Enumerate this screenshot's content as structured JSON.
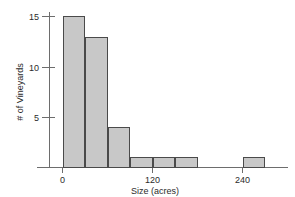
{
  "chart_data": {
    "type": "bar",
    "title": "",
    "subtitle": "",
    "xlabel": "Size (acres)",
    "ylabel": "# of Vineyards",
    "bin_width": 30,
    "bin_starts": [
      0,
      30,
      60,
      90,
      120,
      150,
      180,
      210,
      240
    ],
    "categories": [
      "0-30",
      "30-60",
      "60-90",
      "90-120",
      "120-150",
      "150-180",
      "180-210",
      "210-240",
      "240-270"
    ],
    "values": [
      15,
      13,
      4,
      1,
      1,
      1,
      0,
      0,
      1
    ],
    "x": [
      0,
      30,
      60,
      90,
      120,
      150,
      180,
      210,
      240
    ],
    "xlim": [
      -30,
      300
    ],
    "ylim": [
      0,
      15.8
    ],
    "xticks": [
      0,
      120,
      240
    ],
    "xtick_labels": [
      "0",
      "120",
      "240"
    ],
    "yticks": [
      5,
      10,
      15
    ],
    "ytick_labels": [
      "5",
      "10",
      "15"
    ],
    "grid": false,
    "legend": false,
    "legend_position": "none",
    "bar_fill_color": "#c8c8c8",
    "bar_edge_color": "#4a4a4a",
    "axis_color": "#6d6d6d",
    "text_color": "#2b2b2b",
    "background_color": "#ffffff"
  },
  "axes": {
    "y_title": "# of Vineyards",
    "x_title": "Size (acres)",
    "y_tick_0": "5",
    "y_tick_1": "10",
    "y_tick_2": "15",
    "x_tick_0": "0",
    "x_tick_1": "120",
    "x_tick_2": "240"
  }
}
